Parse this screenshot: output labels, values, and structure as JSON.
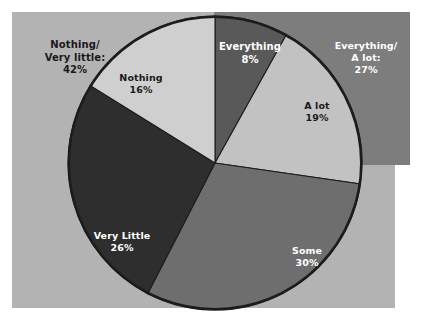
{
  "chart_data": {
    "type": "pie",
    "title": "",
    "subtitle": "",
    "xlabel": "",
    "ylabel": "",
    "legend_position": "none",
    "grid": false,
    "labels_inline": true,
    "start_angle_deg": 0,
    "direction": "clockwise",
    "categories": [
      "Everything",
      "A lot",
      "Some",
      "Very Little",
      "Nothing"
    ],
    "values": [
      8,
      19,
      30,
      26,
      16
    ],
    "value_suffix": "%",
    "slices": [
      {
        "label": "Everything",
        "value": 8,
        "value_text": "8%",
        "color": "#595959",
        "text_color": "#ffffff"
      },
      {
        "label": "A lot",
        "value": 19,
        "value_text": "19%",
        "color": "#c2c2c2",
        "text_color": "#1a1a1a"
      },
      {
        "label": "Some",
        "value": 30,
        "value_text": "30%",
        "color": "#6e6e6e",
        "text_color": "#ffffff"
      },
      {
        "label": "Very Little",
        "value": 26,
        "value_text": "26%",
        "color": "#2e2e2e",
        "text_color": "#ffffff"
      },
      {
        "label": "Nothing",
        "value": 16,
        "value_text": "16%",
        "color": "#cfcfcf",
        "text_color": "#1a1a1a"
      }
    ],
    "groups": [
      {
        "label": "Nothing/\nVery little:",
        "value": 42,
        "value_text": "42%",
        "members": [
          "Nothing",
          "Very Little"
        ],
        "text_color": "#1a1a1a"
      },
      {
        "label": "Everything/\nA lot:",
        "value": 27,
        "value_text": "27%",
        "members": [
          "Everything",
          "A lot"
        ],
        "text_color": "#ffffff"
      }
    ],
    "annotations": []
  },
  "labels": {
    "group_left": {
      "name": "Nothing/\nVery little:",
      "value": "42%"
    },
    "group_right": {
      "name": "Everything/\nA lot:",
      "value": "27%"
    },
    "everything": {
      "name": "Everything",
      "value": "8%"
    },
    "alot": {
      "name": "A lot",
      "value": "19%"
    },
    "some": {
      "name": "Some",
      "value": "30%"
    },
    "verylittle": {
      "name": "Very Little",
      "value": "26%"
    },
    "nothing": {
      "name": "Nothing",
      "value": "16%"
    }
  },
  "style": {
    "page_background": "#ffffff",
    "panel_main_color": "#b3b3b3",
    "panel_accent_color": "#7d7d7d",
    "pie_outline_color": "#1c1c1c",
    "slice_divider_color": "#1c1c1c"
  }
}
